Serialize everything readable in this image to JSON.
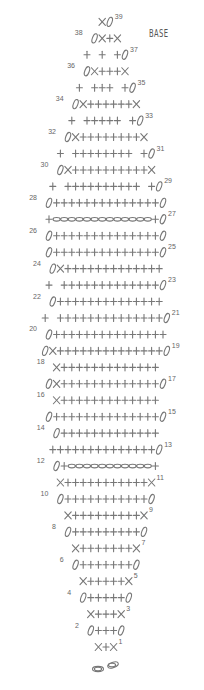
{
  "title": "BASE",
  "legend_symbols": {
    "+": "single crochet (sc)",
    "X": "increase/decrease stitch",
    "0": "chain turn",
    "oval": "chain"
  },
  "rows": [
    {
      "n": 1,
      "side": "right",
      "left": "ch-start",
      "stitches": "X+X"
    },
    {
      "n": 2,
      "side": "left",
      "stitches": "0+++0"
    },
    {
      "n": 3,
      "side": "right",
      "stitches": "X+++X"
    },
    {
      "n": 4,
      "side": "left",
      "stitches": "0+++++0"
    },
    {
      "n": 5,
      "side": "right",
      "stitches": "X+++++X"
    },
    {
      "n": 6,
      "side": "left",
      "stitches": "0+++++++0"
    },
    {
      "n": 7,
      "side": "right",
      "stitches": "X+++++++X"
    },
    {
      "n": 8,
      "side": "left",
      "stitches": "0+++++++++0"
    },
    {
      "n": 9,
      "side": "right",
      "stitches": "X+++++++++X"
    },
    {
      "n": 10,
      "side": "left",
      "stitches": "0+++++++++++0"
    },
    {
      "n": 11,
      "side": "right",
      "stitches": "X+++++++++++X"
    },
    {
      "n": 12,
      "side": "left",
      "stitches": "0+ooooooooooo+"
    },
    {
      "n": 13,
      "side": "right",
      "stitches": "++++++++++++++0"
    },
    {
      "n": 14,
      "side": "left",
      "stitches": "0+++++++++++++"
    },
    {
      "n": 15,
      "side": "right",
      "stitches": "0++++++++++++++0"
    },
    {
      "n": 16,
      "side": "left",
      "stitches": "X+++++++++++++"
    },
    {
      "n": 17,
      "side": "right",
      "stitches": "0X+++++++++++++0"
    },
    {
      "n": 18,
      "side": "left",
      "stitches": "X+++++++++++++"
    },
    {
      "n": 19,
      "side": "right",
      "stitches": "0X++++++++++++++0"
    },
    {
      "n": 20,
      "side": "left",
      "stitches": "0+++++++++++++++"
    },
    {
      "n": 21,
      "side": "right",
      "stitches": "+ ++++++++++++++0"
    },
    {
      "n": 22,
      "side": "left",
      "stitches": "0++++++++++++++"
    },
    {
      "n": 23,
      "side": "right",
      "stitches": "+ +++++++++++++0"
    },
    {
      "n": 24,
      "side": "left",
      "stitches": "0X+++++++++++++"
    },
    {
      "n": 25,
      "side": "right",
      "stitches": "0++++++++++++++0"
    },
    {
      "n": 26,
      "side": "left",
      "stitches": "0++++++++++++++0"
    },
    {
      "n": 27,
      "side": "right",
      "stitches": "+ooooooooooooo+0"
    },
    {
      "n": 28,
      "side": "left",
      "stitches": "0++++++++++++++0"
    },
    {
      "n": 29,
      "side": "right",
      "stitches": "+ ++++++++++ +0"
    },
    {
      "n": 30,
      "side": "left",
      "stitches": "0X++++++++++X"
    },
    {
      "n": 31,
      "side": "right",
      "stitches": "+ ++++++++ +0"
    },
    {
      "n": 32,
      "side": "left",
      "stitches": "0X++++++++X"
    },
    {
      "n": 33,
      "side": "right",
      "stitches": "+ +++++ +0"
    },
    {
      "n": 34,
      "side": "left",
      "stitches": "0X++++++X"
    },
    {
      "n": 35,
      "side": "right",
      "stitches": "+ +++ +0"
    },
    {
      "n": 36,
      "side": "left",
      "stitches": "0X+++X"
    },
    {
      "n": 37,
      "side": "right",
      "stitches": "+ + +0"
    },
    {
      "n": 38,
      "side": "left",
      "stitches": "0X+X"
    },
    {
      "n": 39,
      "side": "right",
      "stitches": "X0"
    }
  ]
}
